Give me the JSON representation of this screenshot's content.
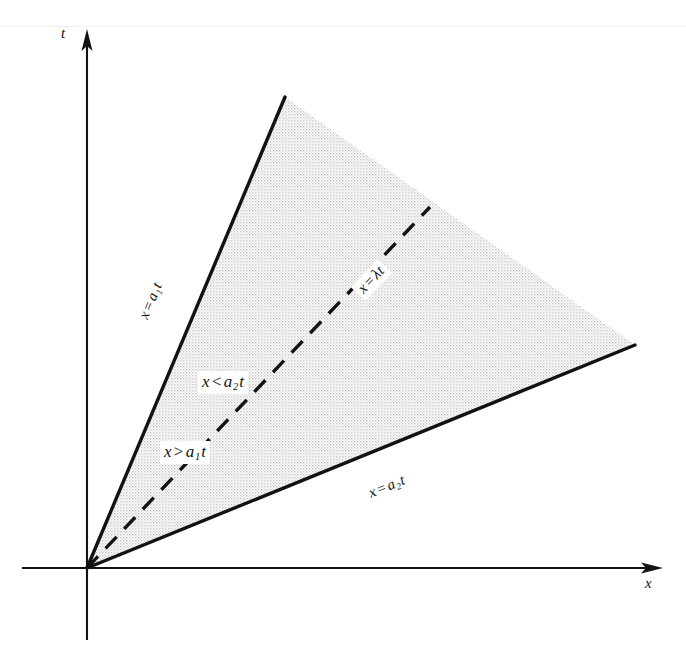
{
  "figure": {
    "kind": "mathematical-diagram",
    "background_color": "#ffffff",
    "ink_color": "#121212",
    "shade_color": "#d8d8d8"
  },
  "axes": {
    "t_axis_label": "t",
    "x_axis_label": "x",
    "origin": {
      "x": 87,
      "y": 568
    },
    "t_axis": {
      "x": 87,
      "top": 30,
      "bottom": 640,
      "arrow": "up"
    },
    "x_axis": {
      "y": 568,
      "left": 22,
      "right": 660,
      "arrow": "right"
    }
  },
  "region": {
    "name": "shaded-wedge",
    "fill": "stipple",
    "vertices": [
      {
        "x": 87,
        "y": 568
      },
      {
        "x": 285,
        "y": 97
      },
      {
        "x": 635,
        "y": 345
      }
    ]
  },
  "boundaries": [
    {
      "id": "upper-characteristic",
      "label": "x = a₁t",
      "label_parts": {
        "lhs": "x",
        "op": "=",
        "coef": "a",
        "sub": "1",
        "var": "t"
      },
      "style": "solid",
      "from": {
        "x": 87,
        "y": 568
      },
      "to": {
        "x": 285,
        "y": 97
      }
    },
    {
      "id": "lower-characteristic",
      "label": "x = a₂t",
      "label_parts": {
        "lhs": "x",
        "op": "=",
        "coef": "a",
        "sub": "2",
        "var": "t"
      },
      "style": "solid",
      "from": {
        "x": 87,
        "y": 568
      },
      "to": {
        "x": 635,
        "y": 345
      }
    },
    {
      "id": "lambda-ray",
      "label": "x = λt",
      "label_parts": {
        "lhs": "x",
        "op": "=",
        "coef": "λ",
        "sub": "",
        "var": "t"
      },
      "style": "dashed",
      "from": {
        "x": 87,
        "y": 568
      },
      "to": {
        "x": 430,
        "y": 207
      }
    }
  ],
  "inequalities": [
    {
      "id": "upper-inequality",
      "label": "x < a₂t",
      "label_parts": {
        "lhs": "x",
        "op": "<",
        "coef": "a",
        "sub": "2",
        "var": "t"
      }
    },
    {
      "id": "lower-inequality",
      "label": "x > a₁t",
      "label_parts": {
        "lhs": "x",
        "op": ">",
        "coef": "a",
        "sub": "1",
        "var": "t"
      }
    }
  ]
}
